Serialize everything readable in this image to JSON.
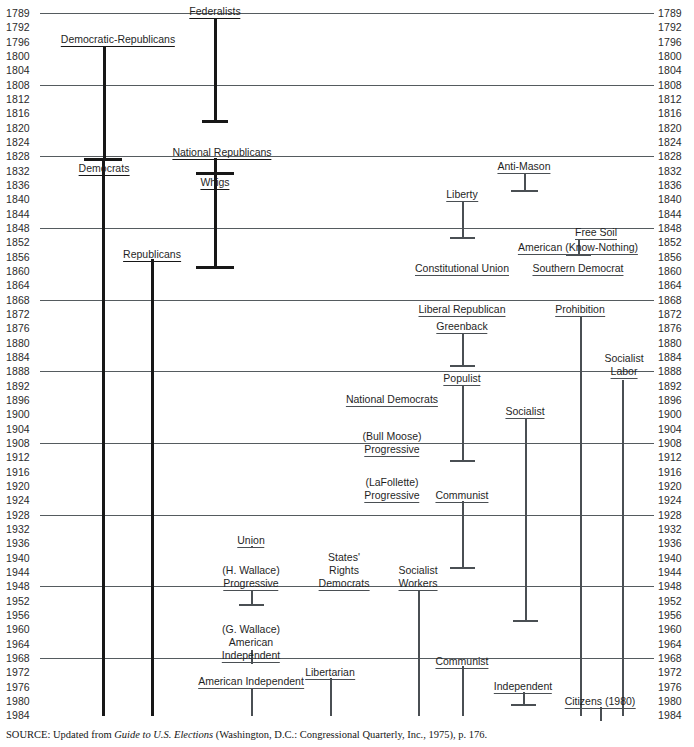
{
  "figure": {
    "source_prefix": "SOURCE: Updated from ",
    "source_italic": "Guide to U.S. Elections",
    "source_suffix": " (Washington, D.C.: Congressional Quarterly, Inc., 1975), p. 176."
  },
  "axis": {
    "ylabel_left": "Year",
    "ylabel_right": "Year",
    "years": [
      1789,
      1792,
      1796,
      1800,
      1804,
      1808,
      1812,
      1816,
      1820,
      1824,
      1828,
      1832,
      1836,
      1840,
      1844,
      1848,
      1852,
      1856,
      1860,
      1864,
      1868,
      1872,
      1876,
      1880,
      1884,
      1888,
      1892,
      1896,
      1900,
      1904,
      1908,
      1912,
      1916,
      1920,
      1924,
      1928,
      1932,
      1936,
      1940,
      1944,
      1948,
      1952,
      1956,
      1960,
      1964,
      1968,
      1972,
      1976,
      1980,
      1984
    ],
    "gridline_years": [
      1789,
      1808,
      1828,
      1848,
      1868,
      1888,
      1908,
      1928,
      1948,
      1968
    ]
  },
  "colors": {
    "major_party": "#171717",
    "minor_party": "#4a4f53",
    "gridline": "#555b5f",
    "text": "#1f1f1f",
    "background": "#ffffff"
  },
  "chart_data": {
    "type": "timeline",
    "xlabel": "",
    "ylabel": "Year",
    "ylim": [
      1789,
      1984
    ],
    "grid": true,
    "legend": "none",
    "axis_note": "Vertical bars show each party's period of national activity; years run 1789 to 1984 (4-year intervals).",
    "parties": [
      {
        "name": "Federalists",
        "start": 1789,
        "end": 1816,
        "major": true,
        "x": 215,
        "label_y": 8,
        "label_x": 215,
        "label_align": "center"
      },
      {
        "name": "Democratic-Republicans",
        "start": 1796,
        "end": 1828,
        "major": true,
        "x": 104,
        "label_y": 33,
        "label_x": 118,
        "label_align": "center"
      },
      {
        "name": "Democrats",
        "start": 1828,
        "end": 1984,
        "major": true,
        "x": 103,
        "label_y": 163,
        "label_x": 103,
        "label_align": "center"
      },
      {
        "name": "National Republicans",
        "start": 1828,
        "end": 1832,
        "major": true,
        "x": 215,
        "label_y": 150,
        "label_x": 222,
        "label_align": "center"
      },
      {
        "name": "Whigs",
        "start": 1832,
        "end": 1856,
        "major": true,
        "x": 215,
        "label_y": 176,
        "label_x": 215,
        "label_align": "center"
      },
      {
        "name": "Republicans",
        "start": 1856,
        "end": 1984,
        "major": true,
        "x": 152,
        "label_y": 251,
        "label_x": 152,
        "label_align": "center"
      },
      {
        "name": "Anti-Mason",
        "start": 1828,
        "end": 1836,
        "major": false,
        "x": 524,
        "label_y": 164,
        "label_x": 524,
        "label_align": "center"
      },
      {
        "name": "Liberty",
        "start": 1840,
        "end": 1848,
        "major": false,
        "x": 462,
        "label_y": 192,
        "label_x": 462,
        "label_align": "center"
      },
      {
        "name": "Free Soil",
        "start": 1848,
        "end": 1852,
        "major": false,
        "x": 596,
        "label_y": 230,
        "label_x": 596,
        "label_align": "center"
      },
      {
        "name": "American (Know-Nothing)",
        "start": 1856,
        "end": 1856,
        "major": false,
        "x": 578,
        "label_y": 244,
        "label_x": 578,
        "label_align": "center"
      },
      {
        "name": "Constitutional Union",
        "start": 1860,
        "end": 1860,
        "major": false,
        "x": 462,
        "label_y": 265,
        "label_x": 462,
        "label_align": "center"
      },
      {
        "name": "Southern Democrat",
        "start": 1860,
        "end": 1860,
        "major": false,
        "x": 578,
        "label_y": 265,
        "label_x": 578,
        "label_align": "center"
      },
      {
        "name": "Liberal Republican",
        "start": 1872,
        "end": 1872,
        "major": false,
        "x": 462,
        "label_y": 307,
        "label_x": 462,
        "label_align": "center"
      },
      {
        "name": "Greenback",
        "start": 1876,
        "end": 1884,
        "major": false,
        "x": 462,
        "label_y": 324,
        "label_x": 462,
        "label_align": "center"
      },
      {
        "name": "Prohibition",
        "start": 1872,
        "end": 1984,
        "major": false,
        "x": 580,
        "label_y": 307,
        "label_x": 580,
        "label_align": "center"
      },
      {
        "name": "Socialist Labor",
        "start": 1888,
        "end": 1984,
        "major": false,
        "x": 622,
        "label_y": 347,
        "label_x": 622,
        "label_align": "center"
      },
      {
        "name": "Populist",
        "start": 1892,
        "end": 1908,
        "major": false,
        "x": 462,
        "label_y": 375,
        "label_x": 462,
        "label_align": "center"
      },
      {
        "name": "National Democrats",
        "start": 1896,
        "end": 1896,
        "major": false,
        "x": 392,
        "label_y": 396,
        "label_x": 392,
        "label_align": "center"
      },
      {
        "name": "Socialist",
        "start": 1900,
        "end": 1956,
        "major": false,
        "x": 525,
        "label_y": 408,
        "label_x": 525,
        "label_align": "center"
      },
      {
        "name": "(Bull Moose) Progressive",
        "start": 1912,
        "end": 1912,
        "major": false,
        "x": 392,
        "label_y": 432,
        "label_x": 392,
        "label_align": "center"
      },
      {
        "name": "(LaFollette) Progressive",
        "start": 1924,
        "end": 1924,
        "major": false,
        "x": 392,
        "label_y": 478,
        "label_x": 392,
        "label_align": "center"
      },
      {
        "name": "Communist",
        "start": 1924,
        "end": 1940,
        "major": false,
        "x": 462,
        "label_y": 491,
        "label_x": 462,
        "label_align": "center"
      },
      {
        "name": "Union",
        "start": 1936,
        "end": 1936,
        "major": false,
        "x": 251,
        "label_y": 536,
        "label_x": 251,
        "label_align": "center"
      },
      {
        "name": "(H. Wallace) Progressive",
        "start": 1948,
        "end": 1952,
        "major": false,
        "x": 251,
        "label_y": 566,
        "label_x": 251,
        "label_align": "center"
      },
      {
        "name": "States' Rights Democrats",
        "start": 1948,
        "end": 1948,
        "major": false,
        "x": 344,
        "label_y": 553,
        "label_x": 344,
        "label_align": "center"
      },
      {
        "name": "Socialist Workers",
        "start": 1948,
        "end": 1984,
        "major": false,
        "x": 418,
        "label_y": 566,
        "label_x": 418,
        "label_align": "center"
      },
      {
        "name": "(G. Wallace) American Independent",
        "start": 1968,
        "end": 1968,
        "major": false,
        "x": 251,
        "label_y": 625,
        "label_x": 251,
        "label_align": "center"
      },
      {
        "name": "Communist",
        "start": 1968,
        "end": 1984,
        "major": false,
        "x": 462,
        "label_y": 658,
        "label_x": 462,
        "label_align": "center"
      },
      {
        "name": "American Independent",
        "start": 1972,
        "end": 1984,
        "major": false,
        "x": 251,
        "label_y": 678,
        "label_x": 251,
        "label_align": "center"
      },
      {
        "name": "Libertarian",
        "start": 1972,
        "end": 1984,
        "major": false,
        "x": 330,
        "label_y": 670,
        "label_x": 330,
        "label_align": "center"
      },
      {
        "name": "Independent",
        "start": 1976,
        "end": 1980,
        "major": false,
        "x": 523,
        "label_y": 683,
        "label_x": 523,
        "label_align": "center"
      },
      {
        "name": "Citizens (1980)",
        "start": 1980,
        "end": 1984,
        "major": false,
        "x": 600,
        "label_y": 698,
        "label_x": 600,
        "label_align": "center"
      }
    ]
  },
  "party_labels": {
    "federalists": "Federalists",
    "democratic_republicans": "Democratic-Republicans",
    "democrats": "Democrats",
    "national_republicans": "National Republicans",
    "whigs": "Whigs",
    "republicans": "Republicans",
    "anti_mason": "Anti-Mason",
    "liberty": "Liberty",
    "free_soil": "Free Soil",
    "american_know_nothing": "American (Know-Nothing)",
    "constitutional_union": "Constitutional Union",
    "southern_democrat": "Southern Democrat",
    "liberal_republican": "Liberal Republican",
    "greenback": "Greenback",
    "prohibition": "Prohibition",
    "socialist_labor_1": "Socialist",
    "socialist_labor_2": "Labor",
    "populist": "Populist",
    "national_democrats": "National Democrats",
    "socialist": "Socialist",
    "bull_moose_1": "(Bull Moose)",
    "bull_moose_2": "Progressive",
    "lafollette_1": "(LaFollette)",
    "lafollette_2": "Progressive",
    "communist_1924": "Communist",
    "union": "Union",
    "h_wallace_1": "(H. Wallace)",
    "h_wallace_2": "Progressive",
    "states_rights_1": "States'",
    "states_rights_2": "Rights",
    "states_rights_3": "Democrats",
    "socialist_workers_1": "Socialist",
    "socialist_workers_2": "Workers",
    "g_wallace_1": "(G. Wallace)",
    "g_wallace_2": "American",
    "g_wallace_3": "Independent",
    "communist_1968": "Communist",
    "american_independent": "American  Independent",
    "libertarian": "Libertarian",
    "independent": "Independent",
    "citizens": "Citizens (1980)"
  }
}
